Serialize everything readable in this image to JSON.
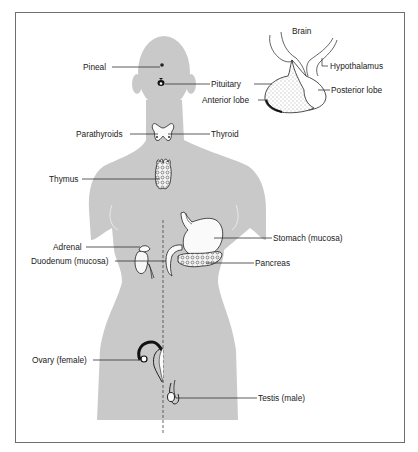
{
  "figure": {
    "body_color": "#c9c9c9",
    "line_color": "#2a2a2a",
    "frame_color": "#6e6e6e"
  },
  "labels": {
    "pineal": "Pineal",
    "pituitary": "Pituitary",
    "parathyroids": "Parathyroids",
    "thyroid": "Thyroid",
    "thymus": "Thymus",
    "adrenal": "Adrenal",
    "duodenum": "Duodenum (mucosa)",
    "stomach": "Stomach (mucosa)",
    "pancreas": "Pancreas",
    "ovary": "Ovary (female)",
    "testis": "Testis (male)"
  },
  "inset": {
    "brain": "Brain",
    "hypothalamus": "Hypothalamus",
    "posterior_lobe": "Posterior lobe",
    "anterior_lobe": "Anterior lobe"
  }
}
